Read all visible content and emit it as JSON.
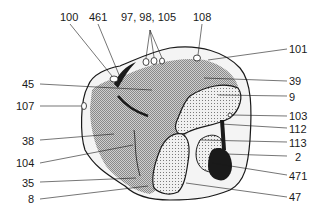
{
  "diagram": {
    "type": "anatomical cross-section",
    "colors": {
      "outline": "#1a1a1a",
      "shade": "#a8a8a8",
      "stipple": "#e6e6e6",
      "dark": "#1a1a1a"
    },
    "labels": {
      "top": [
        {
          "id": "l100",
          "text": "100"
        },
        {
          "id": "l461",
          "text": "461"
        },
        {
          "id": "l97",
          "text": "97, 98, 105"
        },
        {
          "id": "l108",
          "text": "108"
        }
      ],
      "left": [
        {
          "id": "l45",
          "text": "45"
        },
        {
          "id": "l107",
          "text": "107"
        },
        {
          "id": "l38",
          "text": "38"
        },
        {
          "id": "l104",
          "text": "104"
        },
        {
          "id": "l35",
          "text": "35"
        },
        {
          "id": "l8",
          "text": "8"
        }
      ],
      "right": [
        {
          "id": "l101",
          "text": "101"
        },
        {
          "id": "l39",
          "text": "39"
        },
        {
          "id": "l9",
          "text": "9"
        },
        {
          "id": "l103",
          "text": "103"
        },
        {
          "id": "l112",
          "text": "112"
        },
        {
          "id": "l113",
          "text": "113"
        },
        {
          "id": "l2",
          "text": "2"
        },
        {
          "id": "l471",
          "text": "471"
        },
        {
          "id": "l47",
          "text": "47"
        }
      ]
    }
  }
}
